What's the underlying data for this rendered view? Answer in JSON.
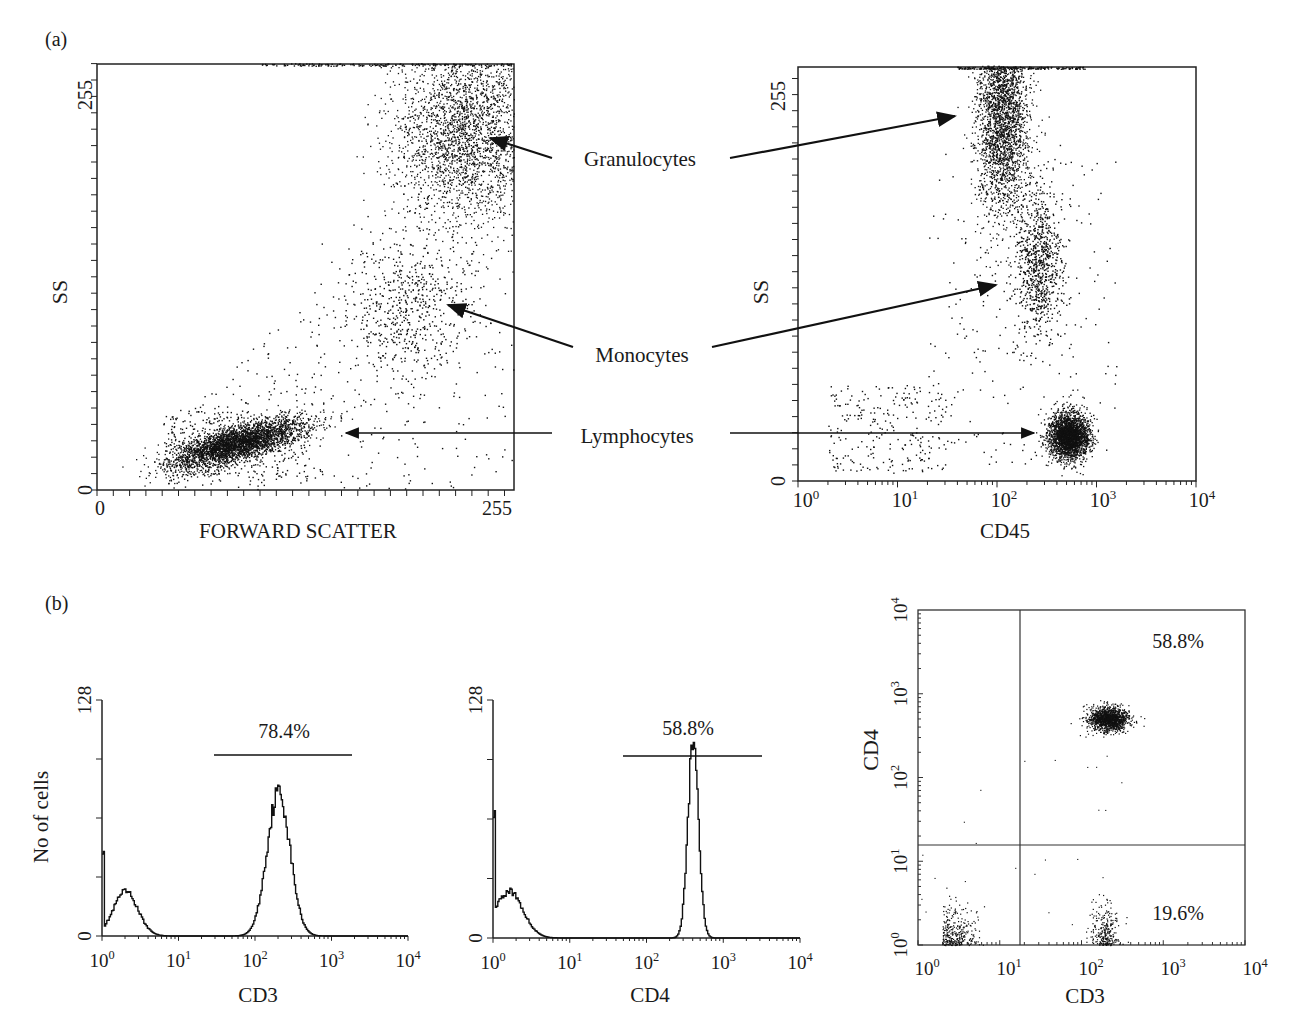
{
  "panels": {
    "a_label": "(a)",
    "b_label": "(b)"
  },
  "annotations": {
    "granulocytes": "Granulocytes",
    "monocytes": "Monocytes",
    "lymphocytes": "Lymphocytes"
  },
  "chart_data": [
    {
      "id": "a-left",
      "type": "scatter",
      "title": "",
      "xlabel": "FORWARD SCATTER",
      "ylabel": "SS",
      "xlim": [
        0,
        255
      ],
      "ylim": [
        0,
        255
      ],
      "x_ticks": [
        "0",
        "255"
      ],
      "y_ticks": [
        "0",
        "255"
      ],
      "grid": false,
      "populations": [
        {
          "name": "Lymphocytes",
          "center": [
            85,
            28
          ],
          "spread": [
            22,
            7
          ],
          "density": "very high"
        },
        {
          "name": "Monocytes",
          "center": [
            195,
            110
          ],
          "spread": [
            25,
            25
          ],
          "density": "low"
        },
        {
          "name": "Granulocytes",
          "center": [
            220,
            215
          ],
          "spread": [
            30,
            35
          ],
          "density": "high"
        }
      ]
    },
    {
      "id": "a-right",
      "type": "scatter",
      "title": "",
      "xlabel": "CD45",
      "ylabel": "SS",
      "xscale": "log",
      "xlim": [
        1,
        10000
      ],
      "ylim": [
        0,
        255
      ],
      "x_ticks": [
        "10^0",
        "10^1",
        "10^2",
        "10^3",
        "10^4"
      ],
      "y_ticks": [
        "0",
        "255"
      ],
      "grid": false,
      "populations": [
        {
          "name": "Granulocytes",
          "center": [
            110,
            230
          ],
          "density": "high"
        },
        {
          "name": "Monocytes",
          "center": [
            280,
            135
          ],
          "density": "medium"
        },
        {
          "name": "Lymphocytes",
          "center": [
            550,
            30
          ],
          "density": "very high"
        }
      ]
    },
    {
      "id": "b-hist-cd3",
      "type": "area",
      "title": "",
      "xlabel": "CD3",
      "ylabel": "No of cells",
      "xscale": "log",
      "xlim": [
        1,
        10000
      ],
      "ylim": [
        0,
        128
      ],
      "x_ticks": [
        "10^0",
        "10^1",
        "10^2",
        "10^3",
        "10^4"
      ],
      "y_ticks": [
        "0",
        "128"
      ],
      "gate": {
        "label": "78.4%",
        "range": [
          25,
          1800
        ]
      },
      "peaks": [
        {
          "x": 1,
          "y": 48
        },
        {
          "x": 2,
          "y": 24
        },
        {
          "x": 200,
          "y": 78
        }
      ]
    },
    {
      "id": "b-hist-cd4",
      "type": "area",
      "title": "",
      "xlabel": "CD4",
      "ylabel": "",
      "xscale": "log",
      "xlim": [
        1,
        10000
      ],
      "ylim": [
        0,
        128
      ],
      "x_ticks": [
        "10^0",
        "10^1",
        "10^2",
        "10^3",
        "10^4"
      ],
      "y_ticks": [
        "0",
        "128"
      ],
      "gate": {
        "label": "58.8%",
        "range": [
          45,
          2800
        ]
      },
      "peaks": [
        {
          "x": 1,
          "y": 70
        },
        {
          "x": 1.6,
          "y": 25
        },
        {
          "x": 400,
          "y": 106
        }
      ]
    },
    {
      "id": "b-quadrant",
      "type": "scatter",
      "title": "",
      "xlabel": "CD3",
      "ylabel": "CD4",
      "xscale": "log",
      "yscale": "log",
      "xlim": [
        1,
        10000
      ],
      "ylim": [
        1,
        10000
      ],
      "x_ticks": [
        "10^0",
        "10^1",
        "10^2",
        "10^3",
        "10^4"
      ],
      "y_ticks": [
        "10^0",
        "10^1",
        "10^2",
        "10^3",
        "10^4"
      ],
      "quadrant_threshold": {
        "x": 17,
        "y": 17
      },
      "quadrant_labels": [
        {
          "quadrant": "upper-right",
          "value": "58.8%"
        },
        {
          "quadrant": "lower-right",
          "value": "19.6%"
        }
      ],
      "populations": [
        {
          "name": "CD3+CD4+",
          "center": [
            200,
            500
          ],
          "density": "very high"
        },
        {
          "name": "CD3+CD4-",
          "center": [
            200,
            1.5
          ],
          "density": "medium"
        },
        {
          "name": "CD3-CD4-",
          "center": [
            2,
            1.5
          ],
          "density": "medium"
        }
      ]
    }
  ]
}
